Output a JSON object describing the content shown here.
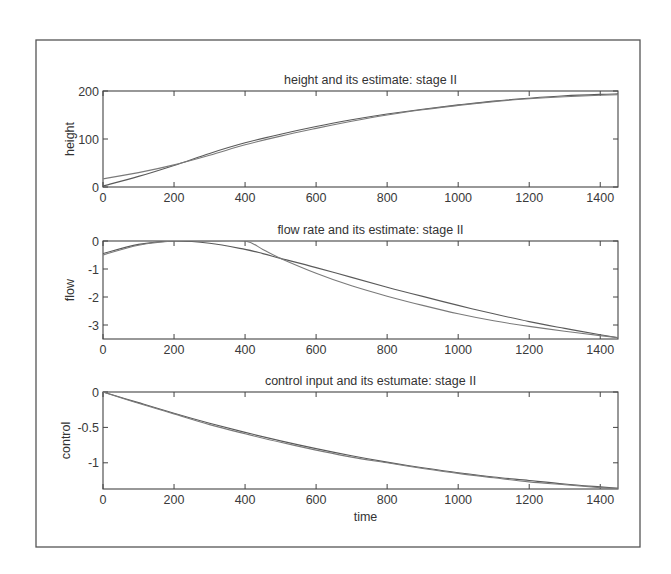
{
  "chart_data": [
    {
      "type": "line",
      "title": "height and its estimate: stage II",
      "xlabel": "",
      "ylabel": "height",
      "xlim": [
        0,
        1450
      ],
      "ylim": [
        0,
        200
      ],
      "xticks": [
        0,
        200,
        400,
        600,
        800,
        1000,
        1200,
        1400
      ],
      "yticks": [
        0,
        100,
        200
      ],
      "ytick_labels": [
        "0",
        "100",
        "200"
      ],
      "grid": false,
      "legend": null,
      "x": [
        0,
        100,
        200,
        300,
        400,
        500,
        600,
        700,
        800,
        900,
        1000,
        1100,
        1200,
        1300,
        1400,
        1450
      ],
      "series": [
        {
          "name": "height",
          "values": [
            2,
            22,
            45,
            70,
            92,
            110,
            126,
            140,
            152,
            162,
            171,
            179,
            185,
            190,
            193,
            194
          ]
        },
        {
          "name": "height estimate",
          "values": [
            17,
            30,
            46,
            66,
            88,
            106,
            122,
            137,
            150,
            161,
            170,
            178,
            184,
            188,
            191,
            192
          ]
        }
      ]
    },
    {
      "type": "line",
      "title": "flow rate and its estimate: stage II",
      "xlabel": "",
      "ylabel": "flow",
      "xlim": [
        0,
        1450
      ],
      "ylim": [
        -3.5,
        0
      ],
      "xticks": [
        0,
        200,
        400,
        600,
        800,
        1000,
        1200,
        1400
      ],
      "yticks": [
        0,
        -1,
        -2,
        -3
      ],
      "ytick_labels": [
        "0",
        "-1",
        "-2",
        "-3"
      ],
      "grid": false,
      "legend": null,
      "x": [
        0,
        100,
        200,
        300,
        400,
        450,
        500,
        600,
        700,
        800,
        900,
        1000,
        1100,
        1200,
        1300,
        1400,
        1450
      ],
      "series": [
        {
          "name": "flow",
          "values": [
            -0.45,
            -0.12,
            0.0,
            -0.08,
            -0.3,
            -0.45,
            -0.62,
            -0.95,
            -1.3,
            -1.65,
            -1.98,
            -2.3,
            -2.6,
            -2.88,
            -3.12,
            -3.35,
            -3.45
          ]
        },
        {
          "name": "flow estimate",
          "values": [
            -0.5,
            -0.15,
            0.0,
            0.0,
            0.0,
            -0.3,
            -0.62,
            -1.15,
            -1.6,
            -1.97,
            -2.3,
            -2.6,
            -2.85,
            -3.05,
            -3.22,
            -3.38,
            -3.45
          ]
        }
      ]
    },
    {
      "type": "line",
      "title": "control input and its estumate: stage II",
      "xlabel": "time",
      "ylabel": "control",
      "xlim": [
        0,
        1450
      ],
      "ylim": [
        -1.37,
        0
      ],
      "xticks": [
        0,
        200,
        400,
        600,
        800,
        1000,
        1200,
        1400
      ],
      "yticks": [
        0,
        -0.5,
        -1
      ],
      "ytick_labels": [
        "0",
        "-0.5",
        "-1"
      ],
      "grid": false,
      "legend": null,
      "x": [
        0,
        100,
        200,
        300,
        400,
        500,
        600,
        700,
        800,
        900,
        1000,
        1100,
        1200,
        1300,
        1400,
        1450
      ],
      "series": [
        {
          "name": "control",
          "values": [
            0,
            -0.15,
            -0.3,
            -0.44,
            -0.57,
            -0.69,
            -0.8,
            -0.9,
            -0.99,
            -1.07,
            -1.14,
            -1.2,
            -1.25,
            -1.3,
            -1.34,
            -1.36
          ]
        },
        {
          "name": "control estimate",
          "values": [
            0,
            -0.16,
            -0.31,
            -0.46,
            -0.59,
            -0.71,
            -0.82,
            -0.92,
            -1.0,
            -1.08,
            -1.15,
            -1.21,
            -1.27,
            -1.31,
            -1.35,
            -1.36
          ]
        }
      ]
    }
  ],
  "layout": {
    "x_px": [
      103,
      618
    ],
    "panels_y_px": [
      [
        91,
        187
      ],
      [
        241,
        339
      ],
      [
        392,
        489
      ]
    ]
  }
}
